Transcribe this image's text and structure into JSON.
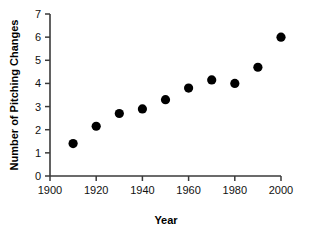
{
  "chart_data": {
    "type": "scatter",
    "title": "",
    "xlabel": "Year",
    "ylabel": "Number of Pitching Changes",
    "xlim": [
      1900,
      2000
    ],
    "ylim": [
      0,
      7
    ],
    "grid": false,
    "legend": false,
    "marker": "filled-circle",
    "marker_color": "#000000",
    "x": [
      1910,
      1920,
      1930,
      1940,
      1950,
      1960,
      1970,
      1980,
      1990,
      2000
    ],
    "values": [
      1.4,
      2.15,
      2.7,
      2.9,
      3.3,
      3.8,
      4.15,
      4.0,
      4.7,
      6.0
    ],
    "xticks": [
      "1900",
      "1920",
      "1940",
      "1960",
      "1980",
      "2000"
    ],
    "xtick_values": [
      1900,
      1920,
      1940,
      1960,
      1980,
      2000
    ],
    "yticks": [
      "0",
      "1",
      "2",
      "3",
      "4",
      "5",
      "6",
      "7"
    ],
    "ytick_values": [
      0,
      1,
      2,
      3,
      4,
      5,
      6,
      7
    ],
    "points": [
      {
        "x": 1910,
        "y": 1.4
      },
      {
        "x": 1920,
        "y": 2.15
      },
      {
        "x": 1930,
        "y": 2.7
      },
      {
        "x": 1940,
        "y": 2.9
      },
      {
        "x": 1950,
        "y": 3.3
      },
      {
        "x": 1960,
        "y": 3.8
      },
      {
        "x": 1970,
        "y": 4.15
      },
      {
        "x": 1980,
        "y": 4.0
      },
      {
        "x": 1990,
        "y": 4.7
      },
      {
        "x": 2000,
        "y": 6.0
      }
    ]
  },
  "axes": {
    "x_title": "Year",
    "y_title": "Number of Pitching Changes"
  },
  "colors": {
    "marker": "#000000",
    "axis": "#3a3a3a",
    "text": "#000000",
    "background": "#ffffff"
  }
}
